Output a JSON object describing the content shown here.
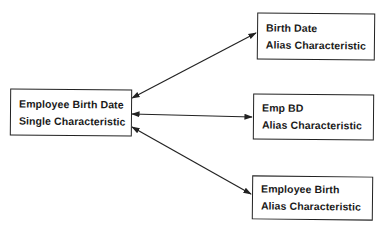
{
  "diagram": {
    "type": "relationship",
    "central_node": {
      "id": "main",
      "line1": "Employee Birth Date",
      "line2": "Single Characteristic"
    },
    "alias_nodes": [
      {
        "id": "a",
        "line1": "Birth Date",
        "line2": "Alias Characteristic"
      },
      {
        "id": "b",
        "line1": "Emp BD",
        "line2": "Alias Characteristic"
      },
      {
        "id": "c",
        "line1": "Employee Birth",
        "line2": "Alias Characteristic"
      }
    ],
    "edges": [
      {
        "from": "main",
        "to": "a",
        "arrows": "both"
      },
      {
        "from": "main",
        "to": "b",
        "arrows": "both"
      },
      {
        "from": "main",
        "to": "c",
        "arrows": "both"
      }
    ],
    "colors": {
      "line": "#222222",
      "background": "#ffffff"
    }
  }
}
